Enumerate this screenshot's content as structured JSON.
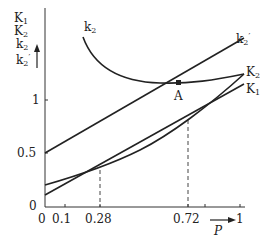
{
  "diagram": {
    "y_axis_labels": [
      {
        "base": "K",
        "sub": "1",
        "prime": ""
      },
      {
        "base": "K",
        "sub": "2",
        "prime": ""
      },
      {
        "base": "k",
        "sub": "2",
        "prime": ""
      },
      {
        "base": "k",
        "sub": "2",
        "prime": "′"
      }
    ],
    "x_axis_label": "P",
    "y_ticks": [
      "0",
      "0.5",
      "1"
    ],
    "x_ticks": [
      "0",
      "0.1",
      "0.28",
      "0.72",
      "1"
    ],
    "curve_labels": {
      "k2": {
        "base": "k",
        "sub": "2"
      },
      "k2_prime": {
        "base": "k",
        "sub": "2",
        "prime": "′"
      },
      "K2": {
        "base": "K",
        "sub": "2"
      },
      "K1": {
        "base": "K",
        "sub": "1"
      }
    },
    "point_label": "A",
    "dashed_markers": [
      "0.28",
      "0.72"
    ],
    "colors": {
      "line": "#222222",
      "background": "#ffffff"
    }
  }
}
